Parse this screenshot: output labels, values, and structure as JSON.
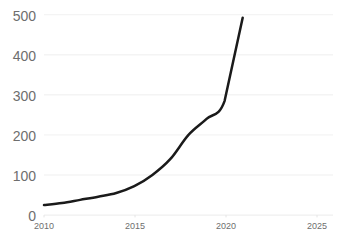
{
  "chart_data": {
    "type": "line",
    "title": "",
    "subtitle": "",
    "xlabel": "",
    "ylabel": "",
    "xlim": [
      2010,
      2026
    ],
    "ylim": [
      0,
      500
    ],
    "grid": true,
    "grid_axis": "y",
    "legend": "none",
    "line_color": "#1a1a1a",
    "grid_color": "#f4f4f4",
    "tick_color": "#6e6e6e",
    "background": "#ffffff",
    "x": [
      2010,
      2011,
      2012,
      2013,
      2014,
      2015,
      2016,
      2017,
      2018,
      2019,
      2020,
      2021
    ],
    "values": [
      25,
      30,
      38,
      46,
      55,
      72,
      100,
      140,
      200,
      240,
      285,
      492
    ],
    "series": [
      {
        "name": "series-1",
        "x": [
          2010,
          2011,
          2012,
          2013,
          2014,
          2015,
          2016,
          2017,
          2018,
          2019,
          2020,
          2021
        ],
        "values": [
          25,
          30,
          38,
          46,
          55,
          72,
          100,
          140,
          200,
          240,
          285,
          492
        ]
      }
    ],
    "yticks": [
      0,
      100,
      200,
      300,
      400,
      500
    ],
    "ytick_labels": [
      "0",
      "100",
      "200",
      "300",
      "400",
      "500"
    ],
    "xticks": [
      2010,
      2015,
      2020,
      2025
    ],
    "xtick_labels": [
      "2010",
      "2015",
      "2020",
      "2025"
    ]
  },
  "axes": {
    "ytick_labels": [
      "500",
      "400",
      "300",
      "200",
      "100",
      "0"
    ],
    "xtick_labels": [
      "2010",
      "2015",
      "2020",
      "2025"
    ]
  }
}
